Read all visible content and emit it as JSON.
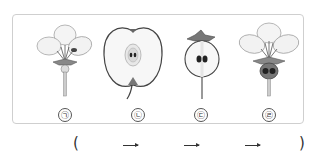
{
  "figures": [
    {
      "id": "a",
      "label": "㉠",
      "description": "apple flower (whole, with petals and stamens)"
    },
    {
      "id": "b",
      "label": "㉡",
      "description": "mature apple fruit cross-section"
    },
    {
      "id": "c",
      "label": "㉢",
      "description": "young apple fruit cross-section with sepals"
    },
    {
      "id": "d",
      "label": "㉣",
      "description": "flower cross-section showing ovary with ovules"
    }
  ],
  "answer": {
    "open_paren": "(",
    "close_paren": ")",
    "arrows": [
      "→",
      "→",
      "→"
    ]
  }
}
